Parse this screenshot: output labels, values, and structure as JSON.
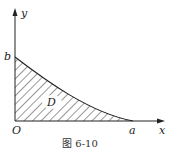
{
  "figure": {
    "caption": "图 6-10",
    "labels": {
      "x_axis": "x",
      "y_axis": "y",
      "origin": "O",
      "x_intercept": "a",
      "y_intercept": "b",
      "region": "D"
    }
  }
}
